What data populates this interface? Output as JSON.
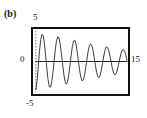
{
  "figure": {
    "panel_label": "(b)",
    "axes": {
      "y_max_label": "5",
      "y_zero_label": "0",
      "y_min_label": "-5",
      "x_max_label": "15"
    }
  },
  "chart_data": {
    "type": "line",
    "title": "(b)",
    "xlabel": "",
    "ylabel": "",
    "xlim": [
      0,
      15
    ],
    "ylim": [
      -5,
      5
    ],
    "grid": false,
    "legend": "none",
    "axis_tick_labels": {
      "y": [
        "5",
        "0",
        "-5"
      ],
      "x": [
        "15"
      ]
    },
    "annotations": [
      "(b)"
    ],
    "series": [
      {
        "name": "damped-oscillation",
        "color": "#333333",
        "x": [
          0.0,
          0.2,
          0.4,
          0.6,
          0.8,
          1.0,
          1.2,
          1.4,
          1.6,
          1.8,
          2.0,
          2.2,
          2.4,
          2.6,
          2.8,
          3.0,
          3.2,
          3.4,
          3.6,
          3.8,
          4.0,
          4.2,
          4.4,
          4.6,
          4.8,
          5.0,
          5.2,
          5.4,
          5.6,
          5.8,
          6.0,
          6.2,
          6.4,
          6.6,
          6.8,
          7.0,
          7.2,
          7.4,
          7.6,
          7.8,
          8.0,
          8.2,
          8.4,
          8.6,
          8.8,
          9.0,
          9.2,
          9.4,
          9.6,
          9.8,
          10.0,
          10.2,
          10.4,
          10.6,
          10.8,
          11.0,
          11.2,
          11.4,
          11.6,
          11.8,
          12.0,
          12.2,
          12.4,
          12.6,
          12.8,
          13.0,
          13.2,
          13.4,
          13.6,
          13.8,
          14.0,
          14.2,
          14.4,
          14.6,
          14.8,
          15.0
        ],
        "y": [
          -4.6,
          -3.1,
          -0.75,
          1.75,
          3.55,
          4.45,
          4.25,
          3.0,
          1.05,
          -1.1,
          -2.95,
          -4.05,
          -4.2,
          -3.4,
          -1.85,
          0.1,
          2.0,
          3.4,
          4.05,
          3.85,
          2.85,
          1.3,
          -0.45,
          -2.1,
          -3.25,
          -3.7,
          -3.35,
          -2.3,
          -0.75,
          0.95,
          2.45,
          3.35,
          3.5,
          2.85,
          1.6,
          0.05,
          -1.45,
          -2.6,
          -3.15,
          -3.0,
          -2.25,
          -1.05,
          0.35,
          1.65,
          2.55,
          2.9,
          2.65,
          1.85,
          0.65,
          -0.65,
          -1.8,
          -2.5,
          -2.65,
          -2.2,
          -1.25,
          -0.1,
          1.05,
          1.95,
          2.4,
          2.3,
          1.75,
          0.85,
          -0.2,
          -1.2,
          -1.9,
          -2.2,
          -2.0,
          -1.4,
          -0.5,
          0.45,
          1.3,
          1.85,
          1.95,
          1.65,
          1.0,
          0.2
        ]
      },
      {
        "name": "zero-line",
        "color": "#222222",
        "x": [
          0,
          15
        ],
        "y": [
          0,
          0
        ]
      }
    ]
  }
}
